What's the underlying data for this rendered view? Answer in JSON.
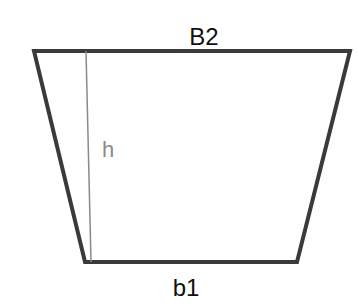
{
  "diagram": {
    "shape": "trapezoid",
    "labels": {
      "top_base": "B2",
      "bottom_base": "b1",
      "height": "h"
    },
    "colors": {
      "outline": "#3a3a3a",
      "height_line": "#8a8a8a",
      "label_text": "#111111",
      "height_text": "#8a8a8a",
      "background": "#ffffff"
    }
  }
}
